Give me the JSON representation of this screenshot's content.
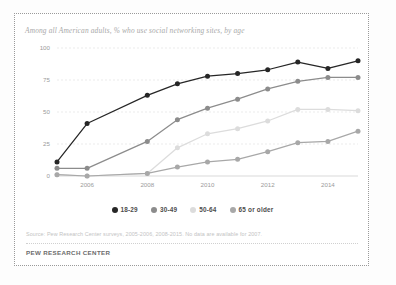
{
  "card": {
    "title": "Among all American adults, % who use social networking sites, by age",
    "source_note": "Source: Pew Research Center surveys, 2005-2006, 2008-2015. No data are available for 2007.",
    "brand": "PEW RESEARCH CENTER"
  },
  "legend": {
    "position": "bottom-center",
    "items": [
      {
        "label": "18-29",
        "color": "#262626",
        "marker": "circle"
      },
      {
        "label": "30-49",
        "color": "#8c8c8c",
        "marker": "circle"
      },
      {
        "label": "50-64",
        "color": "#dcdcdc",
        "marker": "circle"
      },
      {
        "label": "65 or older",
        "color": "#a8a8a8",
        "marker": "circle"
      }
    ]
  },
  "chart_data": {
    "type": "line",
    "title": "Among all American adults, % who use social networking sites, by age",
    "xlabel": "",
    "ylabel": "",
    "x": [
      2005,
      2006,
      2008,
      2009,
      2010,
      2011,
      2012,
      2013,
      2014,
      2015
    ],
    "categories": [
      "2005",
      "2006",
      "2008",
      "2009",
      "2010",
      "2011",
      "2012",
      "2013",
      "2014",
      "2015"
    ],
    "xtick_labels": [
      "2006",
      "2008",
      "2010",
      "2012",
      "2014"
    ],
    "xtick_values": [
      2006,
      2008,
      2010,
      2012,
      2014
    ],
    "ytick_labels": [
      "0",
      "25",
      "50",
      "75",
      "100"
    ],
    "ytick_values": [
      0,
      25,
      50,
      75,
      100
    ],
    "ylim": [
      0,
      100
    ],
    "xlim": [
      2005,
      2015
    ],
    "grid": true,
    "grid_axis": "y",
    "series": [
      {
        "name": "18-29",
        "color": "#262626",
        "values": [
          11,
          41,
          63,
          72,
          78,
          80,
          83,
          89,
          84,
          90
        ]
      },
      {
        "name": "30-49",
        "color": "#8c8c8c",
        "values": [
          6,
          6,
          27,
          44,
          53,
          60,
          68,
          74,
          77,
          77
        ]
      },
      {
        "name": "50-64",
        "color": "#dcdcdc",
        "values": [
          1,
          0,
          2,
          22,
          33,
          37,
          43,
          52,
          52,
          51
        ]
      },
      {
        "name": "65 or older",
        "color": "#a8a8a8",
        "values": [
          1,
          0,
          2,
          7,
          11,
          13,
          19,
          26,
          27,
          35
        ]
      }
    ]
  }
}
